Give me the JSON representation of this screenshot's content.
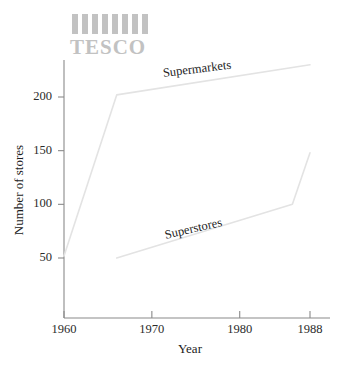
{
  "brand": {
    "name": "TESCO",
    "bar_count": 8,
    "color": "#c2c2c2"
  },
  "chart_data": {
    "type": "line",
    "title": "",
    "xlabel": "Year",
    "ylabel": "Number of stores",
    "xlim": [
      1960,
      1988
    ],
    "ylim": [
      0,
      240
    ],
    "grid": false,
    "legend_position": "inline-labels",
    "xticks": [
      1960,
      1970,
      1980,
      1988
    ],
    "xtick_labels": [
      "1960",
      "1970",
      "1980",
      "1988"
    ],
    "yticks": [
      50,
      100,
      150,
      200
    ],
    "ytick_labels": [
      "50",
      "100",
      "150",
      "200"
    ],
    "line_color": "#e3e3e3",
    "axis_color": "#8a8a8a",
    "series": [
      {
        "name": "Supermarkets",
        "color": "#e3e3e3",
        "x": [
          1960,
          1966,
          1988
        ],
        "values": [
          52,
          202,
          230
        ]
      },
      {
        "name": "Superstores",
        "color": "#e3e3e3",
        "x": [
          1966,
          1986,
          1988
        ],
        "values": [
          50,
          100,
          148
        ]
      }
    ]
  }
}
